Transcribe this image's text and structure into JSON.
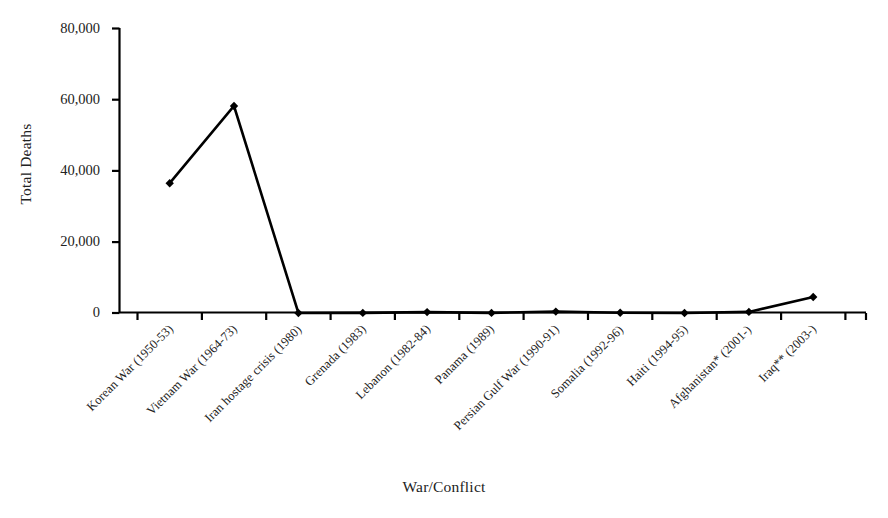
{
  "chart_data": {
    "type": "line",
    "title": "",
    "xlabel": "War/Conflict",
    "ylabel": "Total Deaths",
    "categories": [
      "Korean War (1950-53)",
      "Vietnam War (1964-73)",
      "Iran hostage crisis (1980)",
      "Grenada (1983)",
      "Lebanon (1982-84)",
      "Panama (1989)",
      "Persian Gulf War (1990-91)",
      "Somalia (1992-96)",
      "Haiti (1994-95)",
      "Afghanistan* (2001-)",
      "Iraq** (2003-)"
    ],
    "values": [
      36500,
      58200,
      0,
      19,
      265,
      40,
      383,
      43,
      4,
      300,
      4500
    ],
    "ylim": [
      0,
      80000
    ],
    "yticks": [
      0,
      20000,
      40000,
      60000,
      80000
    ],
    "ytick_labels": [
      "0",
      "20,000",
      "40,000",
      "60,000",
      "80,000"
    ],
    "grid": false,
    "legend": null,
    "marker": "diamond",
    "line_color": "#000000",
    "marker_color": "#000000"
  },
  "axis": {
    "y_title": "Total Deaths",
    "x_title": "War/Conflict"
  }
}
